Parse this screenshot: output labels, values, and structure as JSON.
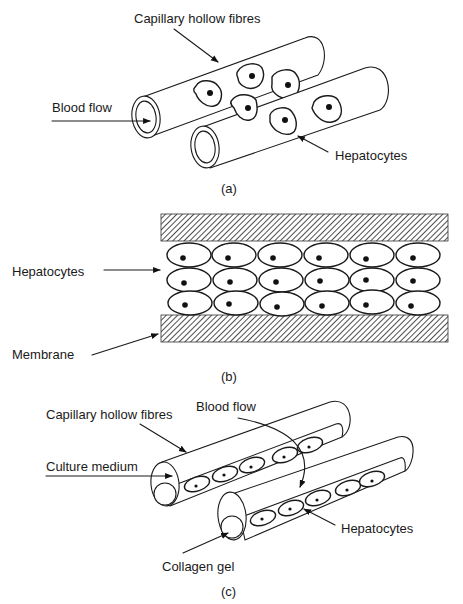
{
  "figure": {
    "panels": [
      {
        "id": "a",
        "caption": "(a)",
        "labels": {
          "fibres": "Capillary hollow fibres",
          "blood_flow": "Blood flow",
          "hepatocytes": "Hepatocytes"
        }
      },
      {
        "id": "b",
        "caption": "(b)",
        "labels": {
          "hepatocytes": "Hepatocytes",
          "membrane": "Membrane"
        },
        "cell_grid": {
          "rows": 3,
          "cols": 6
        }
      },
      {
        "id": "c",
        "caption": "(c)",
        "labels": {
          "fibres": "Capillary hollow fibres",
          "blood_flow": "Blood flow",
          "culture_medium": "Culture medium",
          "hepatocytes": "Hepatocytes",
          "collagen_gel": "Collagen gel"
        }
      }
    ],
    "colors": {
      "ink": "#1a1a1a",
      "background": "#ffffff"
    }
  }
}
